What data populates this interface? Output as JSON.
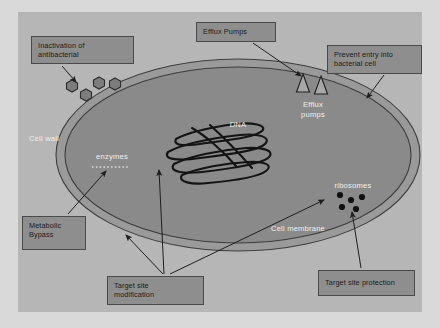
{
  "figure": {
    "colors": {
      "page_background": "#d9d9d9",
      "canvas_background": "#b6b6b6",
      "cell_fill": "#8a8a8a",
      "wall_fill": "#9a9a9a",
      "box_fill": "#8e8e8e",
      "box_border": "#4a4a4a",
      "line": "#2a2a2a",
      "free_label_text": "#f0f0f0",
      "box_label_text": "#1b1b1b",
      "antibiotic_fill": "#7d7d7d",
      "ribosome_fill": "#101010"
    }
  },
  "label_boxes": [
    {
      "name": "inactivation-of-antibacterial",
      "text": "Inactivation of\nantibacterial",
      "x": 31,
      "y": 36,
      "w": 103,
      "h": 28
    },
    {
      "name": "efflux-pumps",
      "text": "Efflux Pumps",
      "x": 196,
      "y": 22,
      "w": 80,
      "h": 20
    },
    {
      "name": "prevent-entry-into-bacterial-cell",
      "text": "Prevent entry into\nbacterial cell",
      "x": 327,
      "y": 45,
      "w": 95,
      "h": 29
    },
    {
      "name": "metabolic-bypass",
      "text": "Metabolic\nBypass",
      "x": 22,
      "y": 216,
      "w": 64,
      "h": 34
    },
    {
      "name": "target-site-modification",
      "text": "Target site\nmodification",
      "x": 107,
      "y": 276,
      "w": 97,
      "h": 29
    },
    {
      "name": "target-site-protection",
      "text": "Target site protection",
      "x": 318,
      "y": 270,
      "w": 97,
      "h": 26
    }
  ],
  "free_labels": [
    {
      "name": "cell-wall",
      "text": "Cell wall",
      "x": 20,
      "y": 134,
      "w": 48
    },
    {
      "name": "enzymes",
      "text": "enzymes",
      "x": 90,
      "y": 152,
      "w": 44
    },
    {
      "name": "dna",
      "text": "DNA",
      "x": 223,
      "y": 120,
      "w": 30
    },
    {
      "name": "efflux-pumps-inline",
      "text": "Efflux\npumps",
      "x": 295,
      "y": 100,
      "w": 36
    },
    {
      "name": "ribosomes",
      "text": "ribosomes",
      "x": 327,
      "y": 181,
      "w": 52
    },
    {
      "name": "cell-membrane",
      "text": "Cell membrane",
      "x": 263,
      "y": 224,
      "w": 70
    }
  ],
  "cell": {
    "name": "bacterial-cell",
    "cx": 238,
    "cy": 155,
    "rx": 182,
    "ry": 96,
    "wall_thickness": 9
  },
  "antibiotic_molecules": [
    {
      "x": 72,
      "y": 86
    },
    {
      "x": 86,
      "y": 95
    },
    {
      "x": 99,
      "y": 83
    },
    {
      "x": 115,
      "y": 84
    }
  ],
  "ribosomes": [
    {
      "x": 340,
      "y": 195
    },
    {
      "x": 351,
      "y": 200
    },
    {
      "x": 362,
      "y": 197
    },
    {
      "x": 342,
      "y": 207
    },
    {
      "x": 356,
      "y": 209
    }
  ],
  "efflux_pump_shapes": [
    {
      "x": 303,
      "y": 76
    },
    {
      "x": 321,
      "y": 78
    }
  ]
}
